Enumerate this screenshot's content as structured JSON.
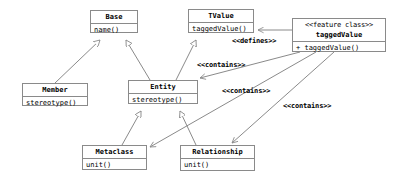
{
  "diagram": {
    "kind": "uml-class-diagram",
    "width": 393,
    "height": 180,
    "colors": {
      "background": "#ffffff",
      "line": "#8a8a8a",
      "text": "#000000"
    }
  },
  "classes": {
    "base": {
      "name": "Base",
      "members": [
        "name()"
      ],
      "x": 90,
      "y": 10,
      "w": 48,
      "h": 23
    },
    "tvalue": {
      "name": "TValue",
      "members": [
        "taggedValue()"
      ],
      "x": 188,
      "y": 9,
      "w": 66,
      "h": 24
    },
    "feature_class": {
      "stereotype": "<<feature class>>",
      "name": "taggedValue",
      "members": [
        "+ taggedValue()"
      ],
      "x": 292,
      "y": 18,
      "w": 94,
      "h": 34
    },
    "member": {
      "name": "Member",
      "members": [
        "stereotype()"
      ],
      "x": 22,
      "y": 83,
      "w": 66,
      "h": 23
    },
    "entity": {
      "name": "Entity",
      "members": [
        "stereotype()"
      ],
      "x": 128,
      "y": 80,
      "w": 70,
      "h": 24
    },
    "metaclass": {
      "name": "Metaclass",
      "members": [
        "unit()"
      ],
      "x": 82,
      "y": 145,
      "w": 65,
      "h": 25
    },
    "relationship": {
      "name": "Relationship",
      "members": [
        "unit()"
      ],
      "x": 180,
      "y": 145,
      "w": 75,
      "h": 26
    }
  },
  "edge_labels": {
    "defines": {
      "text": "<<defines>>",
      "x": 232,
      "y": 37
    },
    "contains_1": {
      "text": "<<contains>>",
      "x": 197,
      "y": 61
    },
    "contains_2": {
      "text": "<<contains>>",
      "x": 222,
      "y": 87
    },
    "contains_3": {
      "text": "<<contains>>",
      "x": 283,
      "y": 102
    }
  },
  "relations": [
    {
      "type": "generalization",
      "from": "member",
      "to": "base"
    },
    {
      "type": "generalization",
      "from": "entity",
      "to": "base"
    },
    {
      "type": "generalization",
      "from": "entity",
      "to": "tvalue"
    },
    {
      "type": "generalization",
      "from": "metaclass",
      "to": "entity"
    },
    {
      "type": "generalization",
      "from": "relationship",
      "to": "entity"
    },
    {
      "type": "dependency",
      "from": "feature_class",
      "to": "tvalue",
      "label": "<<defines>>"
    },
    {
      "type": "dependency",
      "from": "feature_class",
      "to": "entity",
      "label": "<<contains>>"
    },
    {
      "type": "dependency",
      "from": "feature_class",
      "to": "metaclass",
      "label": "<<contains>>"
    },
    {
      "type": "dependency",
      "from": "feature_class",
      "to": "relationship",
      "label": "<<contains>>"
    }
  ]
}
